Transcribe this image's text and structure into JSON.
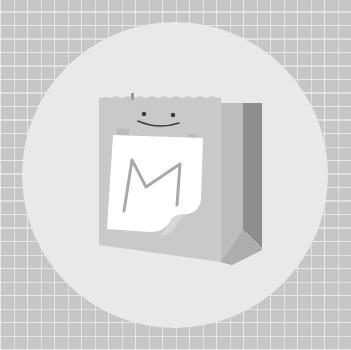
{
  "image": {
    "description": "Grayscale illustration of a paper shopping bag with a smiling face and a white note bearing the letter M, on a light circle over a plaid grid background",
    "letter": "M",
    "colors": {
      "background": "#c6c6c6",
      "grid_lines": "#ffffff",
      "circle": "#e9e9e9",
      "bag_front": "#c9c9c9",
      "bag_side_light": "#bdbdbd",
      "bag_side_dark": "#8e8e8e",
      "bag_fold": "#adadad",
      "note": "#ffffff",
      "letter_stroke": "#a9a9a9",
      "face": "#3a3a3a"
    }
  }
}
